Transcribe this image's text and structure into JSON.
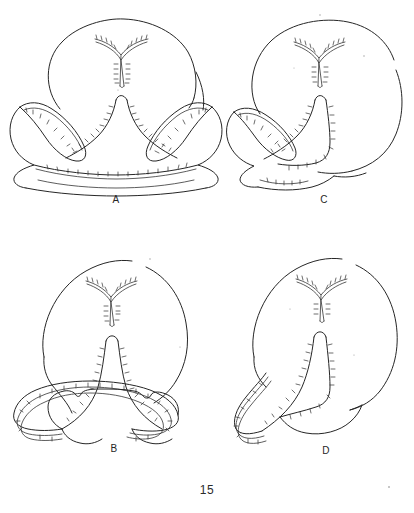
{
  "document": {
    "type": "scientific-illustration-plate",
    "page_number": "15",
    "background_color": "#ffffff",
    "ink_color": "#262626"
  },
  "figures": [
    {
      "id": "A",
      "label": "A",
      "position": "top-left",
      "description": "Symmetric bilobed structure with rounded dorsal body, central Y-shaped notch, paired lateral wing lobes and a broad basal transverse band; margins fringed with fine cilia"
    },
    {
      "id": "C",
      "label": "C",
      "position": "top-right",
      "description": "Asymmetric half view: rounded dorsal body with central Y-shaped notch and a single left lateral lobe with ciliated margin"
    },
    {
      "id": "B",
      "label": "B",
      "position": "bottom-left",
      "description": "Symmetric structure with rounded dorsal body, Y-shaped notch, tall central peaked column and broad paired basal arms with doubled ciliated margins"
    },
    {
      "id": "D",
      "label": "D",
      "position": "bottom-right",
      "description": "Asymmetric half view: rounded dorsal body with Y-shaped notch, tall narrow central column and single sweeping left basal arm with doubled ciliated margin"
    }
  ],
  "page_footer": {
    "number": "15"
  }
}
